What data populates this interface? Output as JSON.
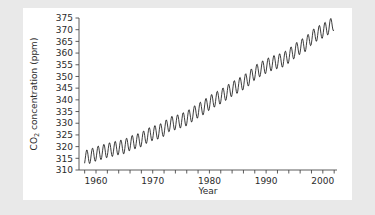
{
  "chart_data": {
    "type": "line",
    "title": "",
    "xlabel": "Year",
    "ylabel": "CO2 concentration (ppm)",
    "ylabel_main": "CO",
    "ylabel_sub": "2",
    "ylabel_rest": " concentration (ppm)",
    "xlim": [
      1957,
      2002.5
    ],
    "ylim": [
      310,
      375
    ],
    "grid": false,
    "legend": false,
    "yticks": [
      310,
      315,
      320,
      325,
      330,
      335,
      340,
      345,
      350,
      355,
      360,
      365,
      370,
      375
    ],
    "ytick_labels": [
      "310",
      "315",
      "320",
      "325",
      "330",
      "335",
      "340",
      "345",
      "350",
      "355",
      "360",
      "365",
      "370",
      "375"
    ],
    "xticks_major": [
      1960,
      1970,
      1980,
      1990,
      2000
    ],
    "xtick_labels": [
      "1960",
      "1970",
      "1980",
      "1990",
      "2000"
    ],
    "xticks_minor_step": 2,
    "xticks_minor": [
      1958,
      1960,
      1962,
      1964,
      1966,
      1968,
      1970,
      1972,
      1974,
      1976,
      1978,
      1980,
      1982,
      1984,
      1986,
      1988,
      1990,
      1992,
      1994,
      1996,
      1998,
      2000,
      2002
    ],
    "seasonal_amplitude_ppm": 3.1,
    "series": [
      {
        "name": "Mauna Loa monthly mean CO2",
        "x": [
          1958.0,
          1959.0,
          1960.0,
          1961.0,
          1962.0,
          1963.0,
          1964.0,
          1965.0,
          1966.0,
          1967.0,
          1968.0,
          1969.0,
          1970.0,
          1971.0,
          1972.0,
          1973.0,
          1974.0,
          1975.0,
          1976.0,
          1977.0,
          1978.0,
          1979.0,
          1980.0,
          1981.0,
          1982.0,
          1983.0,
          1984.0,
          1985.0,
          1986.0,
          1987.0,
          1988.0,
          1989.0,
          1990.0,
          1991.0,
          1992.0,
          1993.0,
          1994.0,
          1995.0,
          1996.0,
          1997.0,
          1998.0,
          1999.0,
          2000.0,
          2001.0,
          2002.0
        ],
        "annual_mean": [
          315.3,
          315.9,
          316.9,
          317.6,
          318.4,
          318.9,
          319.6,
          320.0,
          321.4,
          322.2,
          323.0,
          324.6,
          325.7,
          326.3,
          327.5,
          329.7,
          330.2,
          331.1,
          332.0,
          333.8,
          335.4,
          336.8,
          338.7,
          340.1,
          341.4,
          343.0,
          344.6,
          346.0,
          347.4,
          349.2,
          351.6,
          353.1,
          354.4,
          355.6,
          356.4,
          357.1,
          358.8,
          360.8,
          362.6,
          363.8,
          366.6,
          368.3,
          369.5,
          371.0,
          372.9
        ]
      }
    ]
  },
  "axes": {
    "ylabel_text": "CO2 concentration (ppm)",
    "xlabel_text": "Year"
  }
}
